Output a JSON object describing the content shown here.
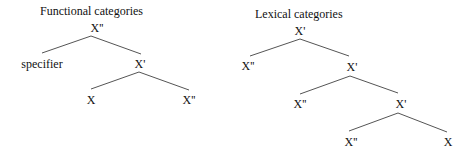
{
  "trees": [
    {
      "title": "Functional categories",
      "nodes": {
        "root": "X''",
        "specifier": "specifier",
        "bar": "X'",
        "head": "X",
        "complement": "X''"
      }
    },
    {
      "title": "Lexical categories",
      "nodes": {
        "root": "X'",
        "adjunct1": "X''",
        "bar1": "X'",
        "adjunct2": "X''",
        "bar2": "X'",
        "complement": "X''",
        "head": "X"
      }
    }
  ],
  "colors": {
    "line": "#555555",
    "text": "#111111"
  }
}
